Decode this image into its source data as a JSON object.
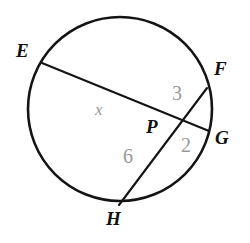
{
  "figure": {
    "type": "circle-with-intersecting-chords",
    "stroke_color": "#141414",
    "measure_color": "#999999",
    "label_color": "#111111",
    "background": "#ffffff",
    "circle": {
      "cx": 120,
      "cy": 109,
      "r": 92
    },
    "points": [
      {
        "name": "E",
        "label": "E",
        "x": 42,
        "y": 63
      },
      {
        "name": "F",
        "label": "F",
        "x": 207,
        "y": 88
      },
      {
        "name": "G",
        "label": "G",
        "x": 209,
        "y": 131
      },
      {
        "name": "H",
        "label": "H",
        "x": 119,
        "y": 205
      },
      {
        "name": "P",
        "label": "P",
        "x": 172,
        "y": 126
      }
    ],
    "chords": [
      {
        "name": "chord-EG",
        "from": "E",
        "to": "G",
        "x1": 42,
        "y1": 63,
        "x2": 209,
        "y2": 131
      },
      {
        "name": "chord-FH",
        "from": "F",
        "to": "H",
        "x1": 207,
        "y1": 88,
        "x2": 119,
        "y2": 205
      }
    ],
    "segment_measures": [
      {
        "name": "EP",
        "label": "x",
        "unknown": true,
        "position": "on chord EG left of P"
      },
      {
        "name": "FP",
        "label": "3",
        "unknown": false,
        "position": "on chord FH above P"
      },
      {
        "name": "PG",
        "label": "2",
        "unknown": false,
        "position": "on chord EG right of P"
      },
      {
        "name": "PH",
        "label": "6",
        "unknown": false,
        "position": "on chord FH below P"
      }
    ]
  },
  "labels": {
    "E": "E",
    "F": "F",
    "G": "G",
    "H": "H",
    "P": "P",
    "x": "x",
    "three": "3",
    "two": "2",
    "six": "6"
  }
}
